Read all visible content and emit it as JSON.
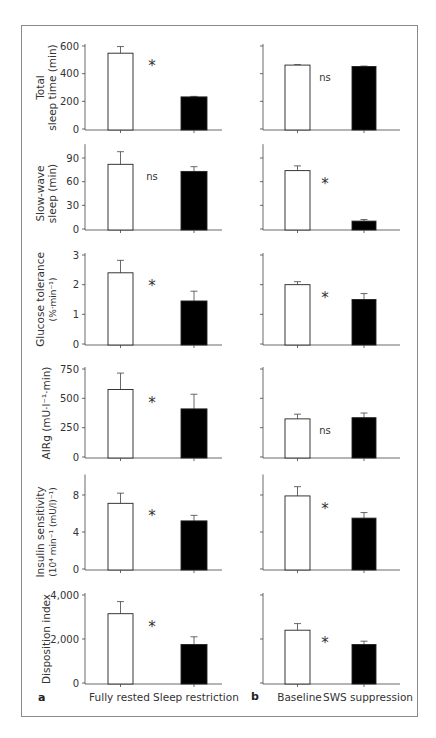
{
  "figure": {
    "panel_labels": [
      "a",
      "b"
    ],
    "conditions_a": [
      "Fully rested",
      "Sleep restriction"
    ],
    "conditions_b": [
      "Baseline",
      "SWS suppression"
    ],
    "bar_colors": {
      "control": "#ffffff",
      "intervention": "#000000"
    }
  },
  "chart_data": [
    {
      "type": "bar",
      "panel": "a",
      "row": 1,
      "ylabel": "Total sleep time (min)",
      "ylabel_lines": [
        "Total",
        "sleep time (min)"
      ],
      "ylim": [
        0,
        600
      ],
      "yticks": [
        0,
        200,
        400,
        600
      ],
      "ytick_labels": [
        "0",
        "200",
        "400",
        "600"
      ],
      "categories": [
        "Fully rested",
        "Sleep restriction"
      ],
      "values": [
        548,
        232
      ],
      "errors": [
        48,
        4
      ],
      "significance": "*"
    },
    {
      "type": "bar",
      "panel": "b",
      "row": 1,
      "ylabel": "Total sleep time (min)",
      "ylim": [
        0,
        600
      ],
      "yticks": [
        0,
        200,
        400,
        600
      ],
      "ytick_labels": [],
      "categories": [
        "Baseline",
        "SWS suppression"
      ],
      "values": [
        462,
        452
      ],
      "errors": [
        3,
        3
      ],
      "significance": "ns"
    },
    {
      "type": "bar",
      "panel": "a",
      "row": 2,
      "ylabel": "Slow-wave sleep (min)",
      "ylabel_lines": [
        "Slow-wave",
        "sleep (min)"
      ],
      "ylim": [
        0,
        105
      ],
      "yticks": [
        0,
        30,
        60,
        90
      ],
      "ytick_labels": [
        "0",
        "30",
        "60",
        "90"
      ],
      "categories": [
        "Fully rested",
        "Sleep restriction"
      ],
      "values": [
        82,
        73
      ],
      "errors": [
        16,
        6
      ],
      "significance": "ns"
    },
    {
      "type": "bar",
      "panel": "b",
      "row": 2,
      "ylabel": "Slow-wave sleep (min)",
      "ylim": [
        0,
        105
      ],
      "yticks": [
        0,
        30,
        60,
        90
      ],
      "ytick_labels": [],
      "categories": [
        "Baseline",
        "SWS suppression"
      ],
      "values": [
        74,
        10
      ],
      "errors": [
        6,
        2
      ],
      "significance": "*"
    },
    {
      "type": "bar",
      "panel": "a",
      "row": 3,
      "ylabel": "Glucose tolerance (%·min⁻¹)",
      "ylabel_lines": [
        "Glucose tolerance",
        "(%·min⁻¹)"
      ],
      "ylim": [
        0,
        3
      ],
      "yticks": [
        0,
        1,
        2,
        3
      ],
      "ytick_labels": [
        "0",
        "1",
        "2",
        "3"
      ],
      "categories": [
        "Fully rested",
        "Sleep restriction"
      ],
      "values": [
        2.4,
        1.45
      ],
      "errors": [
        0.42,
        0.33
      ],
      "significance": "*"
    },
    {
      "type": "bar",
      "panel": "b",
      "row": 3,
      "ylabel": "Glucose tolerance (%·min⁻¹)",
      "ylim": [
        0,
        3
      ],
      "yticks": [
        0,
        1,
        2,
        3
      ],
      "ytick_labels": [],
      "categories": [
        "Baseline",
        "SWS suppression"
      ],
      "values": [
        2.0,
        1.5
      ],
      "errors": [
        0.1,
        0.2
      ],
      "significance": "*"
    },
    {
      "type": "bar",
      "panel": "a",
      "row": 4,
      "ylabel": "AIRg (mU·l⁻¹·min)",
      "ylabel_lines": [
        "AIRg (mU·l⁻¹·min)"
      ],
      "ylim": [
        0,
        750
      ],
      "yticks": [
        0,
        250,
        500,
        750
      ],
      "ytick_labels": [
        "0",
        "250",
        "500",
        "750"
      ],
      "categories": [
        "Fully rested",
        "Sleep restriction"
      ],
      "values": [
        575,
        410
      ],
      "errors": [
        140,
        125
      ],
      "significance": "*"
    },
    {
      "type": "bar",
      "panel": "b",
      "row": 4,
      "ylabel": "AIRg (mU·l⁻¹·min)",
      "ylim": [
        0,
        750
      ],
      "yticks": [
        0,
        250,
        500,
        750
      ],
      "ytick_labels": [],
      "categories": [
        "Baseline",
        "SWS suppression"
      ],
      "values": [
        325,
        335
      ],
      "errors": [
        40,
        40
      ],
      "significance": "ns"
    },
    {
      "type": "bar",
      "panel": "a",
      "row": 5,
      "ylabel": "Insulin sensitivity (10⁴ min⁻¹ (mU/l)⁻¹)",
      "ylabel_lines": [
        "Insulin sensitivity",
        "(10⁴ min⁻¹ (mU/l)⁻¹)"
      ],
      "ylim": [
        0,
        10
      ],
      "yticks": [
        0,
        4,
        8
      ],
      "ytick_labels": [
        "0",
        "4",
        "8"
      ],
      "categories": [
        "Fully rested",
        "Sleep restriction"
      ],
      "values": [
        7.1,
        5.2
      ],
      "errors": [
        1.1,
        0.6
      ],
      "significance": "*"
    },
    {
      "type": "bar",
      "panel": "b",
      "row": 5,
      "ylabel": "Insulin sensitivity (10⁴ min⁻¹ (mU/l)⁻¹)",
      "ylim": [
        0,
        10
      ],
      "yticks": [
        0,
        4,
        8
      ],
      "ytick_labels": [],
      "categories": [
        "Baseline",
        "SWS suppression"
      ],
      "values": [
        7.9,
        5.5
      ],
      "errors": [
        1.0,
        0.6
      ],
      "significance": "*"
    },
    {
      "type": "bar",
      "panel": "a",
      "row": 6,
      "ylabel": "Disposition index",
      "ylabel_lines": [
        "Disposition index"
      ],
      "ylim": [
        0,
        4000
      ],
      "yticks": [
        0,
        2000,
        4000
      ],
      "ytick_labels": [
        "0",
        "2,000",
        "4,000"
      ],
      "categories": [
        "Fully rested",
        "Sleep restriction"
      ],
      "values": [
        3150,
        1750
      ],
      "errors": [
        550,
        350
      ],
      "significance": "*"
    },
    {
      "type": "bar",
      "panel": "b",
      "row": 6,
      "ylabel": "Disposition index",
      "ylim": [
        0,
        4000
      ],
      "yticks": [
        0,
        2000,
        4000
      ],
      "ytick_labels": [],
      "categories": [
        "Baseline",
        "SWS suppression"
      ],
      "values": [
        2400,
        1750
      ],
      "errors": [
        300,
        150
      ],
      "significance": "*"
    }
  ]
}
